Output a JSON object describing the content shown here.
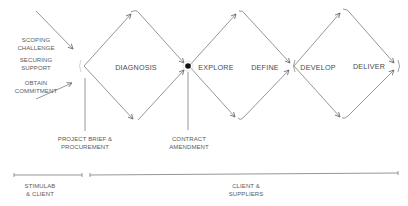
{
  "diagram": {
    "type": "double-diamond-process",
    "colors": {
      "line": "#8a8a8a",
      "text": "#555555",
      "dot": "#111111",
      "background": "#ffffff"
    },
    "inputs": [
      {
        "label_line1": "SCOPING",
        "label_line2": "CHALLENGE"
      },
      {
        "label_line1": "SECURING",
        "label_line2": "SUPPORT"
      },
      {
        "label_line1": "OBTAIN",
        "label_line2": "COMMITMENT"
      }
    ],
    "phases": [
      {
        "label": "DIAGNOSIS"
      },
      {
        "label": "EXPLORE"
      },
      {
        "label": "DEFINE"
      },
      {
        "label": "DEVELOP"
      },
      {
        "label": "DELIVER"
      }
    ],
    "milestones": [
      {
        "label_line1": "PROJECT BRIEF &",
        "label_line2": "PROCUREMENT"
      },
      {
        "label_line1": "CONTRACT",
        "label_line2": "AMENDMENT"
      }
    ],
    "timeline": [
      {
        "label_line1": "STIMULAB",
        "label_line2": "& CLIENT"
      },
      {
        "label_line1": "CLIENT &",
        "label_line2": "SUPPLIERS"
      }
    ]
  }
}
